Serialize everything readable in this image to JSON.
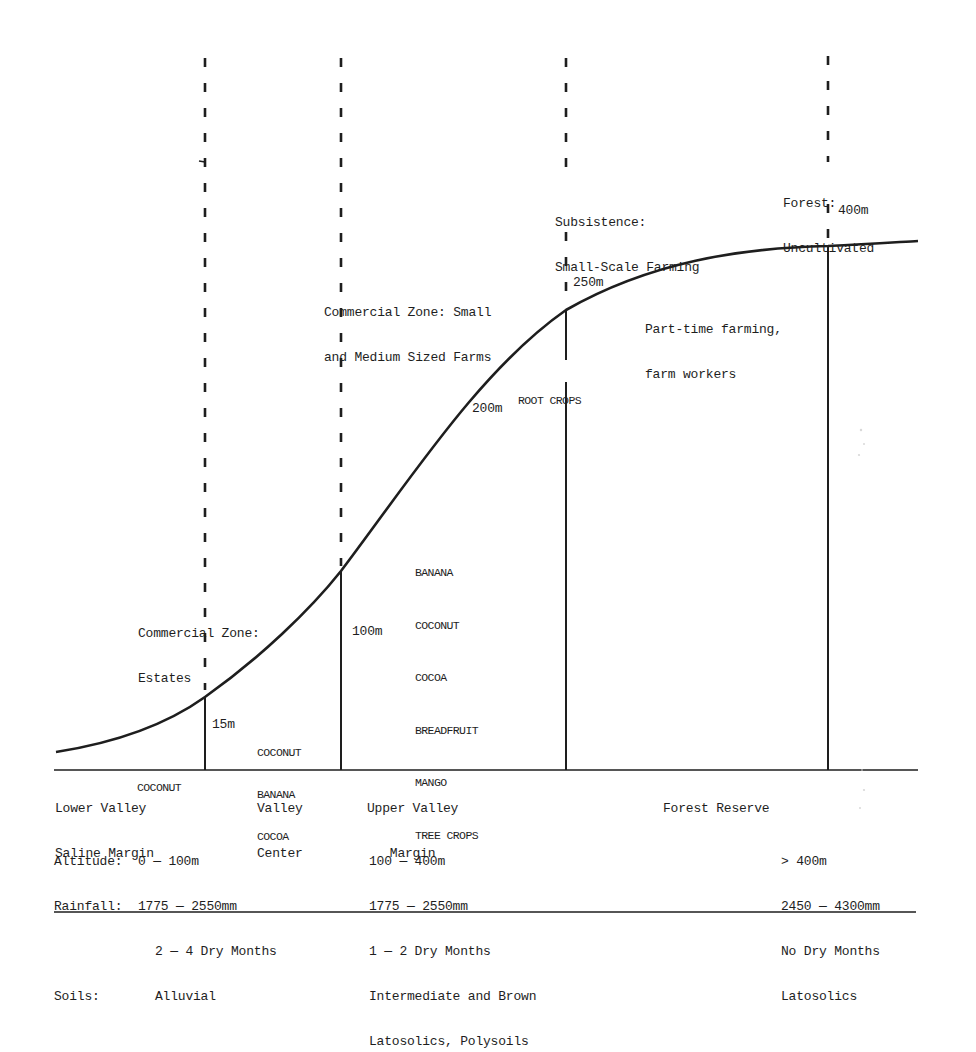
{
  "diagram": {
    "type": "agro-ecological transect profile",
    "zone_headers": {
      "commercial_estates": [
        "Commercial Zone:",
        "Estates"
      ],
      "commercial_small_medium": [
        "Commercial Zone: Small",
        "and Medium Sized Farms"
      ],
      "subsistence": [
        "Subsistence:",
        "Small-Scale Farming"
      ],
      "forest": [
        "Forest:",
        "Uncultivated"
      ]
    },
    "altitude_markers": {
      "m15": "15m",
      "m100": "100m",
      "m200": "200m",
      "m250": "250m",
      "m400": "400m"
    },
    "crops": {
      "lower_valley": [
        "COCONUT"
      ],
      "valley_center": [
        "COCONUT",
        "BANANA",
        "COCOA"
      ],
      "upper_valley": [
        "BANANA",
        "COCONUT",
        "COCOA",
        "BREADFRUIT",
        "MANGO",
        "TREE CROPS"
      ],
      "subsistence": [
        "ROOT CROPS"
      ],
      "part_time": [
        "Part-time farming,",
        "farm workers"
      ]
    },
    "regions": {
      "lower_valley": [
        "Lower Valley",
        "Saline Margin"
      ],
      "valley_center": [
        "Valley",
        "Center"
      ],
      "upper_valley": [
        "Upper Valley",
        "   Margin"
      ],
      "forest_reserve": [
        "Forest Reserve"
      ]
    },
    "conditions": {
      "lowland": {
        "labels": [
          "Altitude:",
          "Rainfall:",
          "",
          "Soils:"
        ],
        "values": [
          "0 — 100m",
          "1775 — 2550mm",
          "2 — 4 Dry Months",
          "Alluvial"
        ]
      },
      "upland": [
        "100 — 400m",
        "1775 — 2550mm",
        "1 — 2 Dry Months",
        "Intermediate and Brown",
        "Latosolics, Polysoils"
      ],
      "forest": [
        "> 400m",
        "2450 — 4300mm",
        "No Dry Months",
        "Latosolics"
      ]
    },
    "colors": {
      "ink": "#1e1e1e",
      "background": "#ffffff"
    }
  }
}
